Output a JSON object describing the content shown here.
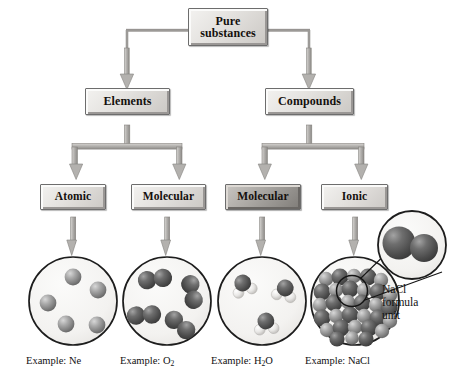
{
  "diagram": {
    "colors": {
      "box_light": "#e4e2df",
      "box_dark": "#a8a5a1",
      "connector": "#9c9a97",
      "outline": "#6d6d6d",
      "sphere_gray": "#9a9a9a",
      "sphere_dark": "#5a5a5a",
      "circle_fill": "#f4f3f1",
      "text": "#111111"
    },
    "levels": {
      "root": {
        "line1": "Pure",
        "line2": "substances"
      },
      "level2": [
        {
          "id": "elements",
          "label": "Elements",
          "shade": "light"
        },
        {
          "id": "compounds",
          "label": "Compounds",
          "shade": "light"
        }
      ],
      "level3": [
        {
          "id": "atomic",
          "label": "Atomic",
          "shade": "light"
        },
        {
          "id": "molecular-element",
          "label": "Molecular",
          "shade": "light"
        },
        {
          "id": "molecular-compound",
          "label": "Molecular",
          "shade": "dark"
        },
        {
          "id": "ionic",
          "label": "Ionic",
          "shade": "light"
        }
      ]
    },
    "examples": [
      {
        "id": "ne",
        "prefix": "Example: ",
        "formula": "Ne",
        "sub": "",
        "tail": ""
      },
      {
        "id": "o2",
        "prefix": "Example: ",
        "formula": "O",
        "sub": "2",
        "tail": ""
      },
      {
        "id": "h2o",
        "prefix": "Example: ",
        "formula": "H",
        "sub": "2",
        "tail": "O"
      },
      {
        "id": "nacl",
        "prefix": "Example: ",
        "formula": "NaCl",
        "sub": "",
        "tail": ""
      }
    ],
    "callout": {
      "line1": "NaCl",
      "line2": "formula",
      "line3": "unit"
    },
    "particle_models": {
      "ne": {
        "description": "five separate gray atoms",
        "count": 5,
        "type": "atoms"
      },
      "o2": {
        "description": "four diatomic molecules of two dark spheres",
        "count": 4,
        "type": "diatomic"
      },
      "h2o": {
        "description": "three bent molecules, dark oxygen with two light hydrogens",
        "count": 3,
        "type": "triatomic"
      },
      "nacl": {
        "description": "ionic lattice of alternating spheres",
        "type": "lattice"
      }
    }
  }
}
